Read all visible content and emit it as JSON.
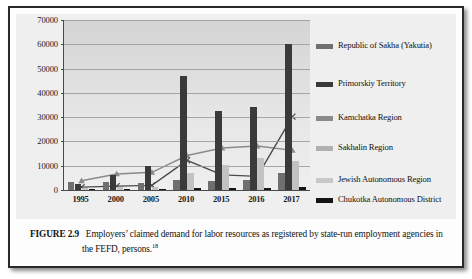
{
  "figure": {
    "label": "FIGURE 2.9",
    "caption": "Employers’ claimed demand for labor resources as registered by state-run employment agencies in the FEFD, persons.",
    "footnote_marker": "18"
  },
  "chart_data": {
    "type": "bar",
    "title": "",
    "xlabel": "",
    "ylabel": "",
    "ylim": [
      0,
      70000
    ],
    "ytick_step": 10000,
    "grid": true,
    "legend_position": "right",
    "categories": [
      "1995",
      "2000",
      "2005",
      "2010",
      "2015",
      "2016",
      "2017"
    ],
    "ytick_labels": [
      "70000",
      "60000",
      "50000",
      "40000",
      "30000",
      "20000",
      "10000",
      "0"
    ],
    "series": [
      {
        "name": "Republic of Sakha (Yakutia)",
        "render": "bar",
        "color": "#6f6f6f",
        "values": [
          3100,
          3300,
          2900,
          4100,
          3900,
          4200,
          7200
        ]
      },
      {
        "name": "Primorskiy Territory",
        "render": "bar",
        "color": "#3a3a3a",
        "values": [
          2500,
          6300,
          9900,
          46800,
          32700,
          34100,
          60100
        ]
      },
      {
        "name": "Kamchatka Region",
        "render": "line",
        "color": "#8a8a8a",
        "marker": "triangle",
        "values": [
          3800,
          6600,
          7300,
          14200,
          17300,
          18100,
          16300
        ]
      },
      {
        "name": "Sakhalin Region",
        "render": "line",
        "color": "#4a4a4a",
        "marker": "cross",
        "values": [
          1200,
          1600,
          1900,
          12200,
          6200,
          5600,
          30200
        ]
      },
      {
        "name": "Jewish Autonomous Region",
        "render": "bar",
        "color": "#c2c2c2",
        "values": [
          900,
          1100,
          1300,
          7100,
          10300,
          13100,
          12100
        ]
      },
      {
        "name": "Chukotka Autonomous District",
        "render": "bar",
        "color": "#141414",
        "values": [
          180,
          220,
          260,
          700,
          900,
          800,
          1100
        ]
      }
    ]
  },
  "legend": {
    "items": [
      {
        "label": "Republic of Sakha (Yakutia)",
        "color": "#6f6f6f"
      },
      {
        "label": "Primorskiy Territory",
        "color": "#3a3a3a"
      },
      {
        "label": "Kamchatka Region",
        "color": "#8a8a8a"
      },
      {
        "label": "Sakhalin Region",
        "color": "#b0b0b0"
      },
      {
        "label": "Jewish Autonomous Region",
        "color": "#c8c8c8"
      },
      {
        "label": "Chukotka Autonomous District",
        "color": "#141414"
      }
    ]
  }
}
